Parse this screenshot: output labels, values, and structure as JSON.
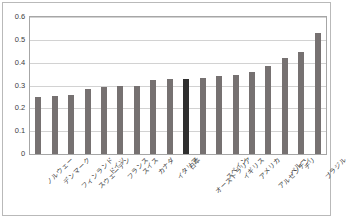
{
  "chart_data": {
    "type": "bar",
    "title": "",
    "subtitle": "",
    "xlabel": "",
    "ylabel": "",
    "ylim": [
      0,
      0.6
    ],
    "ytick_labels": [
      "0.6",
      "0.5",
      "0.4",
      "0.3",
      "0.2",
      "0.1",
      "0"
    ],
    "ytick_values": [
      0.6,
      0.5,
      0.4,
      0.3,
      0.2,
      0.1,
      0
    ],
    "grid": true,
    "legend": false,
    "legend_position": "none",
    "highlight_category": "日本",
    "bar_color": "#767171",
    "highlight_color": "#2f2f2f",
    "categories": [
      "ノルウェー",
      "デンマーク",
      "フィンランド",
      "スウェーデン",
      "ドイツ",
      "フランス",
      "スイス",
      "カナダ",
      "イタリア",
      "日本",
      "オーストラリア",
      "スペイン",
      "イギリス",
      "アメリカ",
      "アルゼンチン",
      "ペルー",
      "チリ",
      "ブラジル"
    ],
    "values": [
      0.25,
      0.255,
      0.26,
      0.285,
      0.295,
      0.297,
      0.297,
      0.322,
      0.327,
      0.33,
      0.335,
      0.34,
      0.345,
      0.36,
      0.385,
      0.42,
      0.445,
      0.53
    ]
  }
}
